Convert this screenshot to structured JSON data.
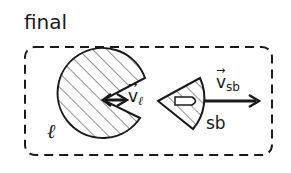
{
  "title": "final",
  "objects": {
    "large_body": {
      "label": "ℓ",
      "shape": "circle-with-wedge-cutout",
      "fill": "hatched"
    },
    "small_body": {
      "label": "sb",
      "shape": "circular-sector",
      "fill": "hatched",
      "inner_glyph": "bullet"
    }
  },
  "vectors": {
    "v_l": {
      "symbol": "v",
      "subscript": "ℓ",
      "arrow": "→"
    },
    "v_sb": {
      "symbol": "v",
      "subscript": "sb",
      "arrow": "→"
    }
  },
  "colors": {
    "stroke": "#1a1a1a",
    "hatch": "#555555",
    "background": "#ffffff"
  }
}
